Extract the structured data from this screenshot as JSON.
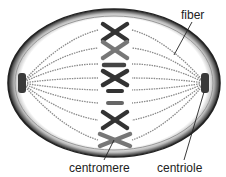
{
  "labels": {
    "fiber": "fiber",
    "centromere": "centromere",
    "centriole": "centriole"
  },
  "colors": {
    "membrane": "#2a2a2a",
    "chromosome_dark": "#333333",
    "chromosome_light": "#777777",
    "fiber": "#8a8a8a",
    "centriole": "#3a3a3a",
    "text": "#222222"
  },
  "chromosomes": [
    {
      "shape": "X",
      "y": 32,
      "tone": "dark"
    },
    {
      "shape": "X",
      "y": 50,
      "tone": "light"
    },
    {
      "shape": "bar",
      "y": 65,
      "tone": "dark"
    },
    {
      "shape": "X",
      "y": 78,
      "tone": "dark"
    },
    {
      "shape": "bar",
      "y": 91,
      "tone": "dark"
    },
    {
      "shape": "bar",
      "y": 103,
      "tone": "light"
    },
    {
      "shape": "X",
      "y": 120,
      "tone": "dark"
    },
    {
      "shape": "X",
      "y": 140,
      "tone": "light"
    }
  ]
}
